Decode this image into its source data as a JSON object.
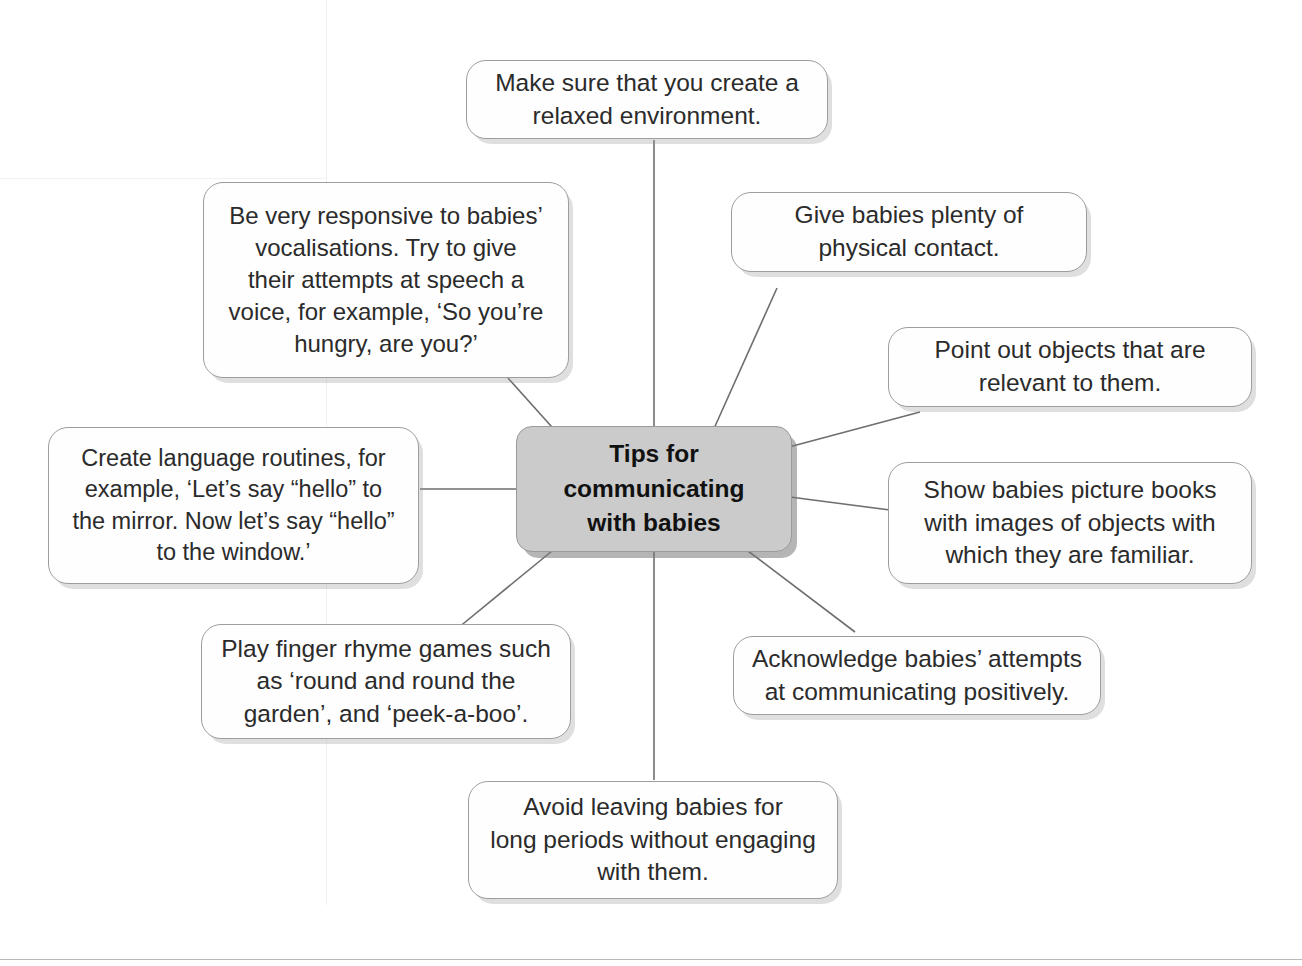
{
  "diagram": {
    "type": "mind-map",
    "title": "Tips for communicating with babies",
    "center": {
      "label": "Tips for\ncommunicating\nwith babies",
      "fill_color": "#cbcbcb",
      "border_color": "#9a9a9a",
      "text_color": "#111111"
    },
    "style": {
      "node_fill": "#fefefe",
      "node_border": "#9d9d9d",
      "connector_color": "#6e6e6e",
      "background": "#ffffff"
    },
    "branches": [
      {
        "id": "relaxed-environment",
        "label": "Make sure that you create a\nrelaxed environment.",
        "position": "top"
      },
      {
        "id": "responsive-vocalisations",
        "label": "Be very responsive to babies’\nvocalisations. Try to give\ntheir attempts at speech a\nvoice, for example, ‘So you’re\nhungry, are you?’",
        "position": "top-left"
      },
      {
        "id": "physical-contact",
        "label": "Give babies plenty of\nphysical contact.",
        "position": "top-right"
      },
      {
        "id": "point-out-objects",
        "label": "Point out objects that are\nrelevant to them.",
        "position": "upper-right"
      },
      {
        "id": "language-routines",
        "label": "Create language routines, for\nexample, ‘Let’s say “hello” to\nthe mirror. Now let’s say “hello”\nto the window.’",
        "position": "left"
      },
      {
        "id": "picture-books",
        "label": "Show babies picture books\nwith images of objects with\nwhich they are familiar.",
        "position": "right"
      },
      {
        "id": "finger-rhyme-games",
        "label": "Play finger rhyme games such\nas ‘round and round the\ngarden’, and ‘peek-a-boo’.",
        "position": "bottom-left"
      },
      {
        "id": "acknowledge-attempts",
        "label": "Acknowledge babies’ attempts\nat communicating positively.",
        "position": "bottom-right"
      },
      {
        "id": "avoid-leaving-babies",
        "label": "Avoid leaving babies for\nlong periods without engaging\nwith them.",
        "position": "bottom"
      }
    ]
  }
}
